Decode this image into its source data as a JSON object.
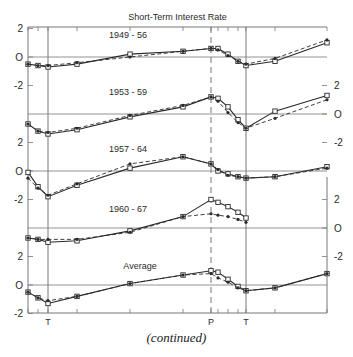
{
  "chart_data": {
    "type": "line",
    "title": "Short-Term Interest Rate",
    "caption": "(continued)",
    "xlabel": "",
    "ylabel": "",
    "x_markers": [
      {
        "label": "T",
        "x_index": 2,
        "style": "solid"
      },
      {
        "label": "P",
        "x_index": 6,
        "style": "dashed"
      },
      {
        "label": "T",
        "x_index": 10,
        "style": "solid"
      }
    ],
    "x_positions_px": [
      28,
      38,
      48,
      77,
      130,
      183,
      211,
      218,
      228,
      238,
      246,
      275,
      327
    ],
    "ylim_each_panel": [
      -2,
      2
    ],
    "y_ticks": [
      "2",
      "0",
      "-2"
    ],
    "grid": false,
    "legend": "none (solid line with open squares and dashed line with filled markers per panel)",
    "panels": [
      {
        "label": "1949 - 56",
        "axis_side": "left",
        "series": [
          {
            "name": "solid",
            "values": [
              -0.5,
              -0.6,
              -0.7,
              -0.5,
              0.2,
              0.4,
              0.6,
              0.6,
              0.2,
              -0.3,
              -0.6,
              -0.3,
              1.0
            ]
          },
          {
            "name": "dashed",
            "values": [
              -0.5,
              -0.6,
              -0.6,
              -0.4,
              0.0,
              0.4,
              0.6,
              0.5,
              0.1,
              -0.3,
              -0.5,
              -0.1,
              1.2
            ]
          }
        ]
      },
      {
        "label": "1953 - 59",
        "axis_side": "right",
        "series": [
          {
            "name": "solid",
            "values": [
              -0.7,
              -1.2,
              -1.4,
              -1.1,
              -0.2,
              0.5,
              1.2,
              1.1,
              0.5,
              -0.4,
              -1.0,
              0.2,
              1.3
            ]
          },
          {
            "name": "dashed",
            "values": [
              -0.7,
              -1.2,
              -1.3,
              -1.0,
              -0.1,
              0.6,
              1.2,
              0.9,
              0.1,
              -0.6,
              -1.0,
              -0.3,
              1.0
            ]
          }
        ]
      },
      {
        "label": "1957 - 64",
        "axis_side": "left",
        "series": [
          {
            "name": "solid",
            "values": [
              -0.1,
              -1.1,
              -1.8,
              -1.0,
              0.2,
              1.0,
              0.5,
              0.0,
              -0.2,
              -0.4,
              -0.5,
              -0.4,
              0.3
            ]
          },
          {
            "name": "dashed",
            "values": [
              -0.5,
              -1.2,
              -1.7,
              -0.9,
              0.5,
              1.0,
              0.5,
              0.1,
              -0.3,
              -0.4,
              -0.5,
              -0.4,
              0.2
            ]
          }
        ]
      },
      {
        "label": "1960 - 67",
        "axis_side": "right",
        "series": [
          {
            "name": "solid",
            "values": [
              -0.7,
              -0.8,
              -1.0,
              -0.9,
              -0.2,
              0.8,
              2.0,
              1.8,
              1.5,
              1.1,
              0.7,
              null,
              null
            ]
          },
          {
            "name": "dashed",
            "values": [
              -0.7,
              -0.8,
              -0.8,
              -0.8,
              -0.3,
              0.8,
              1.0,
              0.9,
              0.8,
              0.6,
              0.4,
              null,
              null
            ]
          }
        ]
      },
      {
        "label": "Average",
        "axis_side": "left",
        "series": [
          {
            "name": "solid",
            "values": [
              -0.5,
              -0.9,
              -1.3,
              -0.8,
              0.1,
              0.7,
              1.0,
              0.9,
              0.4,
              -0.1,
              -0.4,
              -0.2,
              0.8
            ]
          },
          {
            "name": "dashed",
            "values": [
              -0.5,
              -0.9,
              -1.1,
              -0.8,
              0.1,
              0.7,
              0.8,
              0.5,
              0.2,
              -0.2,
              -0.4,
              -0.2,
              0.8
            ]
          }
        ]
      }
    ]
  },
  "layout": {
    "frame": {
      "left": 28,
      "right": 327,
      "top": 27,
      "bottom": 313
    },
    "panel_zero_y": [
      57,
      114,
      171,
      228,
      285
    ],
    "px_per_unit": 14.25,
    "title_y": 20,
    "marker_label_y": 325
  }
}
